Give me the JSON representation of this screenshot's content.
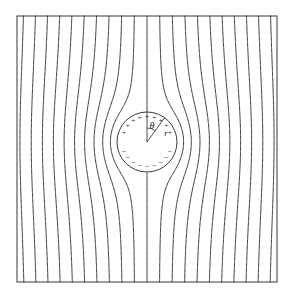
{
  "figure": {
    "kind": "physics-field-line-diagram",
    "title": "",
    "caption": "",
    "background_color": "#ffffff",
    "line_color": "#3a3a3a",
    "frame_color": "#4a4a4a",
    "label_color": "#1a1a1a",
    "frame": {
      "x": 17,
      "y": 16,
      "width": 260,
      "height": 266,
      "stroke_width": 1.1
    },
    "sphere": {
      "center_x": 147,
      "center_y": 142,
      "radius": 30,
      "stroke_width": 1.0,
      "fill": "#ffffff"
    },
    "labels": {
      "theta": "θ",
      "r": "r",
      "theta_x": 152,
      "theta_y": 129,
      "r_x": 166,
      "r_y": 136
    },
    "charges": {
      "positive_symbol": "+",
      "negative_symbol": "−",
      "positive_count": 9,
      "negative_count": 9,
      "positive_hemisphere": "upper",
      "negative_hemisphere": "lower"
    },
    "field": {
      "direction": "vertical",
      "line_count": 21,
      "uniform_far_field": true,
      "stroke_width": 1.0
    }
  },
  "chart_data": {
    "type": "line",
    "title": "",
    "xlabel": "",
    "ylabel": "",
    "grid": false,
    "legend_position": "none",
    "xlim": [
      -1.3,
      1.3
    ],
    "ylim": [
      -1.33,
      1.33
    ],
    "annotations": [
      {
        "text": "θ",
        "x": 0.1,
        "y": 0.35
      },
      {
        "text": "r",
        "x": 0.22,
        "y": 0.2
      }
    ],
    "series": [
      {
        "name": "field-line-1",
        "x_at_infinity": -1.2
      },
      {
        "name": "field-line-2",
        "x_at_infinity": -1.08
      },
      {
        "name": "field-line-3",
        "x_at_infinity": -0.96
      },
      {
        "name": "field-line-4",
        "x_at_infinity": -0.84
      },
      {
        "name": "field-line-5",
        "x_at_infinity": -0.72
      },
      {
        "name": "field-line-6",
        "x_at_infinity": -0.6
      },
      {
        "name": "field-line-7",
        "x_at_infinity": -0.48
      },
      {
        "name": "field-line-8",
        "x_at_infinity": -0.36
      },
      {
        "name": "field-line-9",
        "x_at_infinity": -0.24
      },
      {
        "name": "field-line-10",
        "x_at_infinity": -0.12
      },
      {
        "name": "field-line-11",
        "x_at_infinity": 0.0
      },
      {
        "name": "field-line-12",
        "x_at_infinity": 0.12
      },
      {
        "name": "field-line-13",
        "x_at_infinity": 0.24
      },
      {
        "name": "field-line-14",
        "x_at_infinity": 0.36
      },
      {
        "name": "field-line-15",
        "x_at_infinity": 0.48
      },
      {
        "name": "field-line-16",
        "x_at_infinity": 0.6
      },
      {
        "name": "field-line-17",
        "x_at_infinity": 0.72
      },
      {
        "name": "field-line-18",
        "x_at_infinity": 0.84
      },
      {
        "name": "field-line-19",
        "x_at_infinity": 0.96
      },
      {
        "name": "field-line-20",
        "x_at_infinity": 1.08
      },
      {
        "name": "field-line-21",
        "x_at_infinity": 1.2
      }
    ],
    "sphere_radius_data_units": 0.3,
    "sphere_center_data_units": [
      0.0,
      0.0
    ]
  }
}
